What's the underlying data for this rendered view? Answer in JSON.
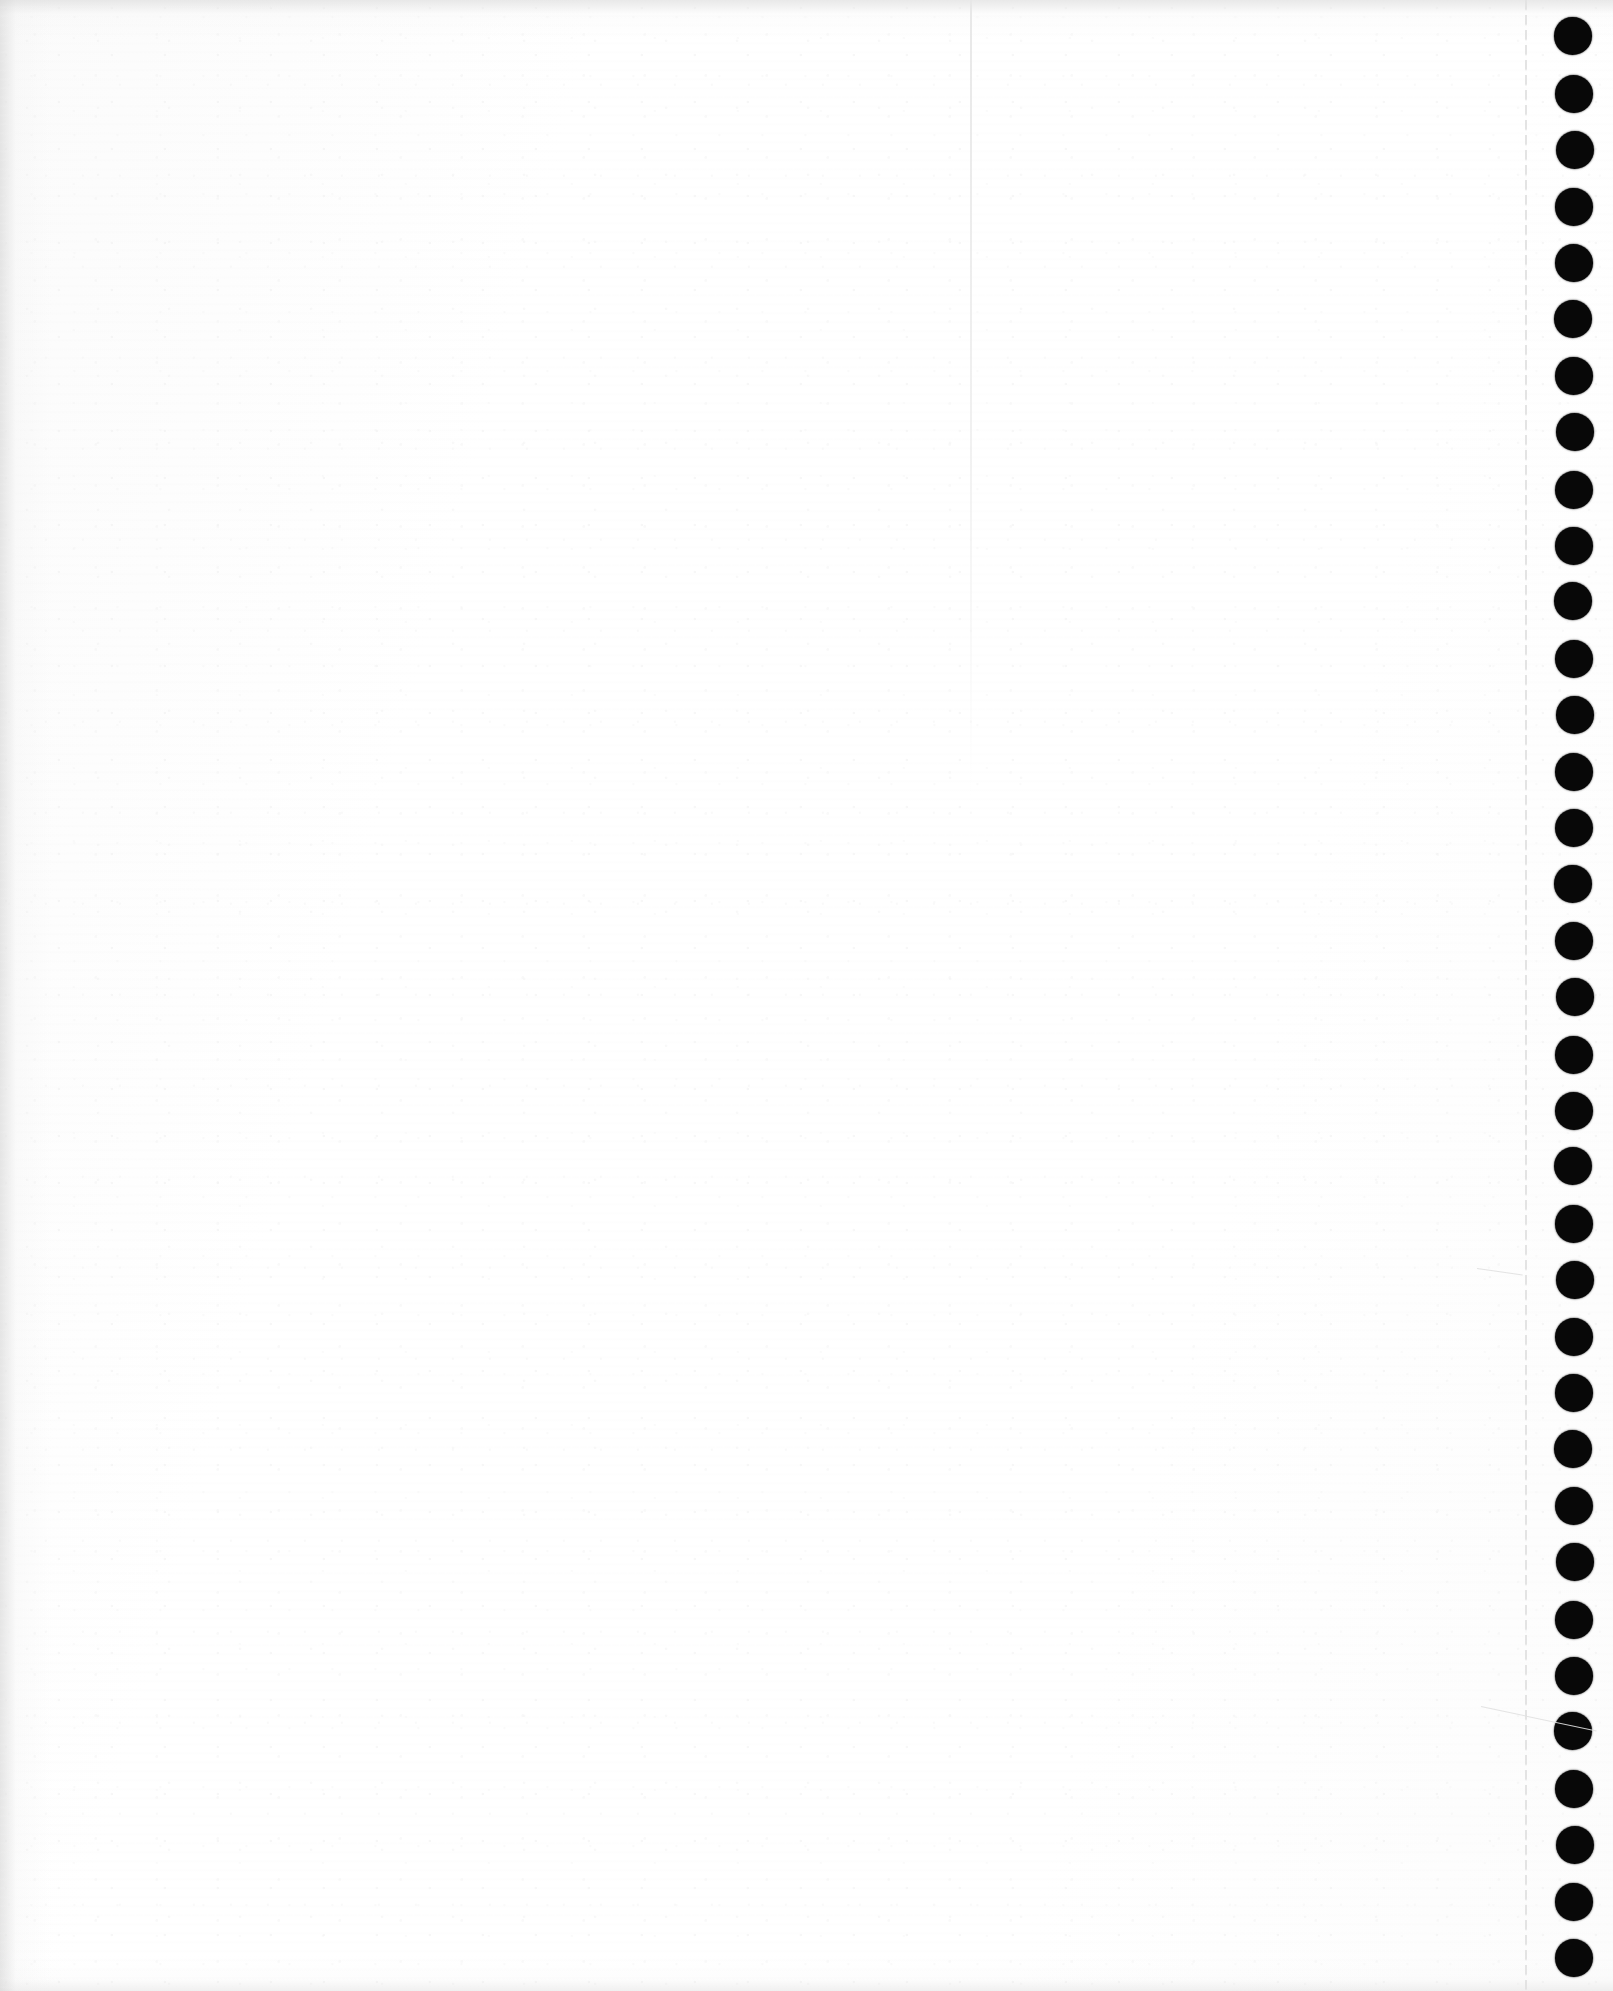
{
  "document": {
    "kind": "scanned-page",
    "title": "Blank continuous-feed printer page (scan)",
    "page_width": 1613,
    "page_height": 1991,
    "background_color": "#ffffff",
    "text_content": "",
    "notes_label": ""
  },
  "paper": {
    "substrate_color": "#ffffff",
    "edge_shadow_color": "#d6d6d6",
    "grain_color": "#e9e9e9",
    "top_edge_shadow_height": 40,
    "left_edge_shadow_width": 52,
    "bottom_edge_shadow_height": 36
  },
  "fold_crease": {
    "color": "#e7e7e7",
    "x": 970,
    "y": 0,
    "height": 795,
    "width": 2
  },
  "perforation": {
    "label": "tear-off perforation",
    "color": "#e2e2e2",
    "x": 1525,
    "width": 2
  },
  "sprocket": {
    "label": "tractor-feed sprocket holes",
    "color": "#080808",
    "center_x": 1574,
    "diameter": 38,
    "first_center_y": 37,
    "spacing": 56.5,
    "count": 35
  },
  "scratches": [
    {
      "x": 1481,
      "y": 1706,
      "length": 118,
      "angle": 12,
      "thickness": 1
    },
    {
      "x": 1477,
      "y": 1268,
      "length": 46,
      "angle": 8,
      "thickness": 1
    }
  ]
}
